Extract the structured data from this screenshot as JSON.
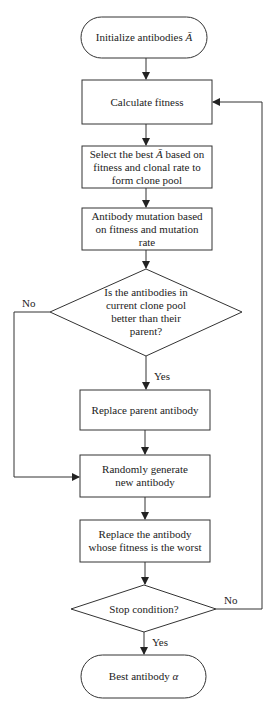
{
  "diagram": {
    "type": "flowchart",
    "nodes": [
      {
        "id": "start",
        "shape": "terminal",
        "label": "Initialize antibodies",
        "symbol": "Ā"
      },
      {
        "id": "fitness",
        "shape": "process",
        "label": "Calculate fitness"
      },
      {
        "id": "select",
        "shape": "process",
        "label_pre": "Select the best",
        "symbol": "Ā",
        "label_post": "based on fitness and clonal rate to form clone pool"
      },
      {
        "id": "mutation",
        "shape": "process",
        "label": "Antibody mutation based on fitness and mutation rate"
      },
      {
        "id": "decision1",
        "shape": "decision",
        "label": "Is the antibodies in current clone pool better than their parent?"
      },
      {
        "id": "replace_parent",
        "shape": "process",
        "label": "Replace parent antibody"
      },
      {
        "id": "random",
        "shape": "process",
        "label": "Randomly generate new antibody"
      },
      {
        "id": "replace_worst",
        "shape": "process",
        "label": "Replace the antibody whose fitness is the worst"
      },
      {
        "id": "decision2",
        "shape": "decision",
        "label": "Stop condition?"
      },
      {
        "id": "end",
        "shape": "terminal",
        "label": "Best antibody",
        "symbol": "α"
      }
    ],
    "edges": [
      {
        "from": "start",
        "to": "fitness"
      },
      {
        "from": "fitness",
        "to": "select"
      },
      {
        "from": "select",
        "to": "mutation"
      },
      {
        "from": "mutation",
        "to": "decision1"
      },
      {
        "from": "decision1",
        "to": "replace_parent",
        "label": "Yes"
      },
      {
        "from": "decision1",
        "to": "random",
        "label": "No"
      },
      {
        "from": "replace_parent",
        "to": "random"
      },
      {
        "from": "random",
        "to": "replace_worst"
      },
      {
        "from": "replace_worst",
        "to": "decision2"
      },
      {
        "from": "decision2",
        "to": "end",
        "label": "Yes"
      },
      {
        "from": "decision2",
        "to": "fitness",
        "label": "No"
      }
    ]
  },
  "labels": {
    "start_text": "Initialize antibodies",
    "start_sym": "Ā",
    "fitness": "Calculate fitness",
    "select_pre": "Select the best",
    "select_sym": "Ā",
    "select_post": "based on fitness and clonal rate to form clone pool",
    "mutation": "Antibody mutation based on fitness and mutation rate",
    "decision1": "Is the antibodies in current clone pool better than their parent?",
    "replace_parent": "Replace parent antibody",
    "random": "Randomly generate new antibody",
    "replace_worst": "Replace the antibody whose fitness is the worst",
    "decision2": "Stop condition?",
    "end_text": "Best antibody",
    "end_sym": "α",
    "no1": "No",
    "yes1": "Yes",
    "no2": "No",
    "yes2": "Yes"
  }
}
